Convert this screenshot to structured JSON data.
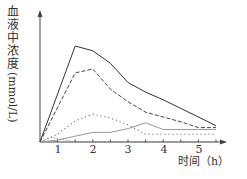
{
  "chart_data": {
    "type": "line",
    "title": "",
    "xlabel": "时间（h）",
    "ylabel": "血液中浓度(mmol/L)",
    "x_ticks": [
      "1",
      "2",
      "3",
      "4",
      "5"
    ],
    "xlim": [
      0,
      5.4
    ],
    "grid": false,
    "legend": null,
    "series": [
      {
        "name": "solid",
        "style": "solid",
        "x": [
          0,
          1,
          1.5,
          2,
          2.5,
          3,
          3.5,
          4,
          4.5,
          5
        ],
        "y": [
          0,
          1.0,
          0.95,
          0.82,
          0.62,
          0.52,
          0.44,
          0.35,
          0.26,
          0.17
        ]
      },
      {
        "name": "dashed",
        "style": "dashed",
        "x": [
          0,
          1,
          1.5,
          2,
          2.5,
          3,
          3.5,
          4,
          4.5,
          5
        ],
        "y": [
          0,
          0.72,
          0.76,
          0.55,
          0.42,
          0.31,
          0.26,
          0.21,
          0.15,
          0.15
        ]
      },
      {
        "name": "dotted-upper",
        "style": "dotted",
        "x": [
          0,
          0.5,
          1,
          1.5,
          2,
          2.5,
          3,
          3.5,
          4,
          4.5,
          5
        ],
        "y": [
          0,
          0.08,
          0.22,
          0.29,
          0.25,
          0.18,
          0.08,
          0.08,
          0.08,
          0.08,
          0.08
        ]
      },
      {
        "name": "gray-solid",
        "style": "solid-light",
        "x": [
          0,
          0.5,
          1,
          1.5,
          2,
          2.5,
          3,
          3.5,
          4,
          4.5,
          5
        ],
        "y": [
          0,
          0.02,
          0.06,
          0.1,
          0.1,
          0.14,
          0.2,
          0.13,
          0.13,
          0.13,
          0.13
        ]
      },
      {
        "name": "dotted-lower",
        "style": "dotted-fine",
        "x": [
          0,
          0.3,
          1.0,
          5
        ],
        "y": [
          0,
          0.05,
          0.0,
          0.0
        ]
      }
    ]
  },
  "axis": {
    "y_label_chars": [
      "血",
      "液",
      "中",
      "浓",
      "度"
    ],
    "y_label_unit": "(mmol/L)",
    "x_label": "时间（h）",
    "ticks": [
      "1",
      "2",
      "3",
      "4",
      "5"
    ]
  }
}
